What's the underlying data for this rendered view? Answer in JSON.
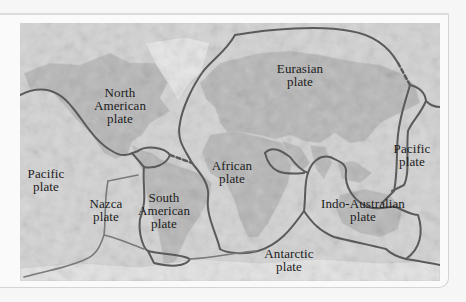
{
  "figure": {
    "title": "",
    "type": "world map of tectonic plates",
    "colors": {
      "ocean": "#d2d2d2",
      "land": "#b4b4b4",
      "boundary": "#5a5a5a",
      "label": "#1c1c1c"
    },
    "boundary_styles": {
      "solid": "known plate boundary",
      "dashed": "uncertain plate boundary"
    }
  },
  "labels": {
    "north_american": "North\nAmerican\nplate",
    "eurasian": "Eurasian\nplate",
    "pacific_east": "Pacific\nplate",
    "pacific_west": "Pacific\nplate",
    "african": "African\nplate",
    "nazca": "Nazca\nplate",
    "south_american": "South\nAmerican\nplate",
    "indo_australian": "Indo-Australian\nplate",
    "antarctic": "Antarctic\nplate"
  }
}
